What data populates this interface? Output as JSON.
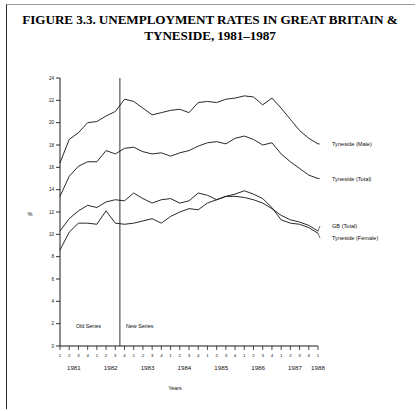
{
  "figure": {
    "title_line1": "FIGURE 3.3. UNEMPLOYMENT RATES IN GREAT BRITAIN &",
    "title_line2": "TYNESIDE, 1981–1987"
  },
  "annotations": {
    "old_series": "Old Series",
    "new_series": "New Series",
    "break_quarter_index": 6
  },
  "chart_data": {
    "type": "line",
    "title": "FIGURE 3.3. UNEMPLOYMENT RATES IN GREAT BRITAIN & TYNESIDE, 1981–1987",
    "xlabel": "Years",
    "ylabel": "%",
    "ylim": [
      0,
      24
    ],
    "yticks": [
      0,
      2,
      4,
      6,
      8,
      10,
      12,
      14,
      16,
      18,
      20,
      22,
      24
    ],
    "grid": false,
    "legend_position": "right-inline-labels",
    "x_major_labels": [
      "1981",
      "1982",
      "1983",
      "1984",
      "1985",
      "1986",
      "1987",
      "1988"
    ],
    "x_minor_labels": [
      "1",
      "2",
      "3",
      "4",
      "1",
      "2",
      "3",
      "4",
      "1",
      "2",
      "3",
      "4",
      "1",
      "2",
      "3",
      "4",
      "1",
      "2",
      "3",
      "4",
      "1",
      "2",
      "3",
      "4",
      "1",
      "2",
      "3",
      "4",
      "1"
    ],
    "x": [
      "1981 Q1",
      "1981 Q2",
      "1981 Q3",
      "1981 Q4",
      "1982 Q1",
      "1982 Q2",
      "1982 Q3",
      "1982 Q4",
      "1983 Q1",
      "1983 Q2",
      "1983 Q3",
      "1983 Q4",
      "1984 Q1",
      "1984 Q2",
      "1984 Q3",
      "1984 Q4",
      "1985 Q1",
      "1985 Q2",
      "1985 Q3",
      "1985 Q4",
      "1986 Q1",
      "1986 Q2",
      "1986 Q3",
      "1986 Q4",
      "1987 Q1",
      "1987 Q2",
      "1987 Q3",
      "1987 Q4",
      "1988 Q1"
    ],
    "series": [
      {
        "name": "Tyneside (Male)",
        "values": [
          16.4,
          18.5,
          19.1,
          20.0,
          20.1,
          20.6,
          21.0,
          22.1,
          21.9,
          21.3,
          20.7,
          20.9,
          21.1,
          21.2,
          20.9,
          21.8,
          21.9,
          21.8,
          22.1,
          22.2,
          22.4,
          22.3,
          21.6,
          22.2,
          21.3,
          20.3,
          19.3,
          18.6,
          18.1
        ]
      },
      {
        "name": "Tyneside (Total)",
        "values": [
          13.4,
          15.2,
          16.1,
          16.5,
          16.5,
          17.5,
          17.2,
          17.7,
          17.8,
          17.4,
          17.2,
          17.3,
          17.0,
          17.3,
          17.5,
          17.9,
          18.2,
          18.3,
          18.1,
          18.6,
          18.8,
          18.5,
          18.0,
          18.2,
          17.2,
          16.5,
          15.9,
          15.3,
          15.0
        ]
      },
      {
        "name": "GB (Total)",
        "values": [
          10.3,
          11.4,
          12.1,
          12.6,
          12.4,
          12.9,
          13.1,
          13.0,
          13.7,
          13.2,
          12.8,
          13.1,
          13.2,
          12.8,
          13.0,
          13.7,
          13.5,
          13.1,
          13.4,
          13.4,
          13.3,
          13.1,
          12.8,
          12.3,
          11.7,
          11.3,
          11.1,
          10.8,
          10.3
        ]
      },
      {
        "name": "Tyneside (Female)",
        "values": [
          8.6,
          10.2,
          11.0,
          11.0,
          10.9,
          12.1,
          11.0,
          10.9,
          11.0,
          11.2,
          11.4,
          11.0,
          11.6,
          12.0,
          12.3,
          12.2,
          12.8,
          13.1,
          13.4,
          13.6,
          13.9,
          13.6,
          13.2,
          12.4,
          11.3,
          11.0,
          10.9,
          10.6,
          10.1
        ]
      }
    ]
  }
}
